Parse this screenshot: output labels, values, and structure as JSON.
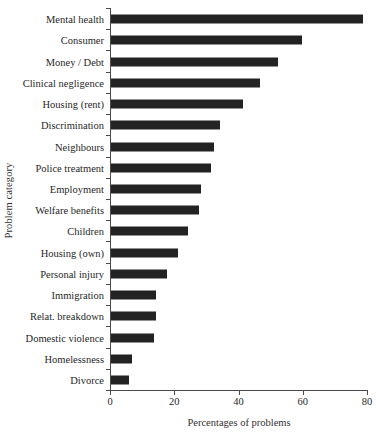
{
  "chart_data": {
    "type": "bar",
    "orientation": "horizontal",
    "title": "",
    "xlabel": "Percentages of problems",
    "ylabel": "Problem category",
    "xlim": [
      0,
      80
    ],
    "xticks": [
      0,
      20,
      40,
      60,
      80
    ],
    "xtick_labels": [
      "0",
      "20",
      "40",
      "60",
      "80"
    ],
    "grid": false,
    "legend": null,
    "bar_color": "#232323",
    "axis_color": "#4a4a4a",
    "categories": [
      "Mental health",
      "Consumer",
      "Money / Debt",
      "Clinical negligence",
      "Housing (rent)",
      "Discrimination",
      "Neighbours",
      "Police treatment",
      "Employment",
      "Welfare benefits",
      "Children",
      "Housing (own)",
      "Personal injury",
      "Immigration",
      "Relat. breakdown",
      "Domestic violence",
      "Homelessness",
      "Divorce"
    ],
    "values": [
      78.5,
      59.5,
      52.0,
      46.5,
      41.0,
      34.0,
      32.0,
      31.0,
      28.0,
      27.5,
      24.0,
      21.0,
      17.5,
      14.0,
      14.0,
      13.5,
      6.5,
      5.5
    ]
  }
}
